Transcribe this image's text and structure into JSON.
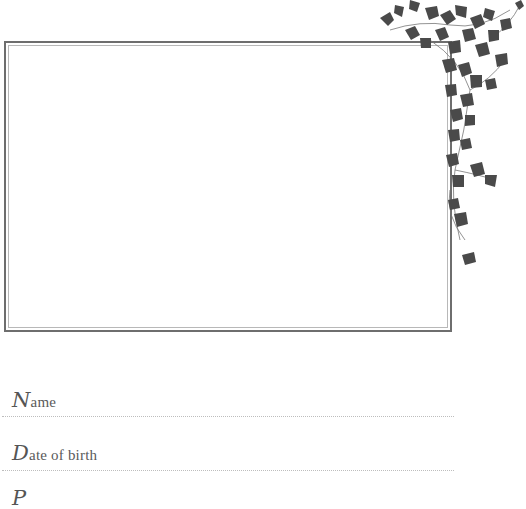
{
  "page": {
    "type": "photo-record-page",
    "frame": {
      "border_color": "#6e6e6e",
      "inner_border_color": "#b8b8b8"
    },
    "decoration": {
      "name": "ivy-vine",
      "color": "#4a4a4a"
    },
    "fields": [
      {
        "initial": "N",
        "rest": "ame"
      },
      {
        "initial": "D",
        "rest": "ate of birth"
      },
      {
        "initial": "P",
        "rest": ""
      }
    ]
  }
}
